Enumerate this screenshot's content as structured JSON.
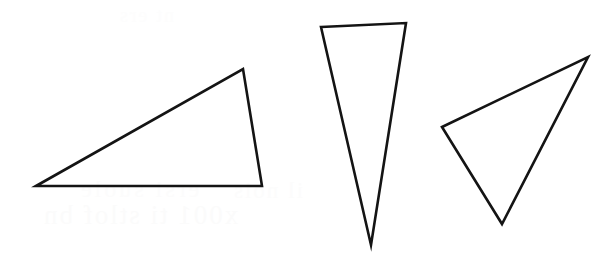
{
  "figure": {
    "background_color": "#ffffff",
    "stroke_color": "#141414",
    "stroke_width": 2.6,
    "canvas": {
      "width": 616,
      "height": 268
    }
  },
  "shapes": [
    {
      "id": "triangle-left",
      "label": "Left triangle",
      "kind": "triangle",
      "classification": "obtuse scalene",
      "points": "36,186 243,69 262,186",
      "vertices": [
        {
          "name": "left-vertex",
          "x": 36,
          "y": 186
        },
        {
          "name": "apex-vertex",
          "x": 243,
          "y": 69
        },
        {
          "name": "bottom-right-vertex",
          "x": 262,
          "y": 186
        }
      ]
    },
    {
      "id": "triangle-middle",
      "label": "Middle triangle",
      "kind": "triangle",
      "classification": "narrow acute, apex pointing down",
      "points": "321,27 406,23 371,245",
      "vertices": [
        {
          "name": "top-left-vertex",
          "x": 321,
          "y": 27
        },
        {
          "name": "top-right-vertex",
          "x": 406,
          "y": 23
        },
        {
          "name": "bottom-tip-vertex",
          "x": 371,
          "y": 245
        }
      ]
    },
    {
      "id": "triangle-right",
      "label": "Right triangle",
      "kind": "triangle",
      "classification": "rotated scalene",
      "points": "442,127 588,57 502,224",
      "vertices": [
        {
          "name": "left-vertex",
          "x": 442,
          "y": 127
        },
        {
          "name": "top-right-vertex",
          "x": 588,
          "y": 57
        },
        {
          "name": "bottom-vertex",
          "x": 502,
          "y": 224
        }
      ]
    }
  ],
  "background_artifacts": {
    "note": "Extremely faint mirrored bleed-through text from the reverse of the page",
    "marks": [
      {
        "id": "ghost-a",
        "text": "x001 ti stlof bn"
      },
      {
        "id": "ghost-b",
        "text": "ersi suole"
      },
      {
        "id": "ghost-c",
        "text": "il nois"
      },
      {
        "id": "ghost-d",
        "text": "nt ers"
      }
    ]
  }
}
